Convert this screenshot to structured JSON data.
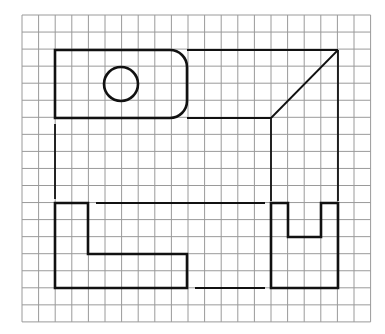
{
  "diagram": {
    "type": "three-view technical drawing",
    "grid": {
      "origin_x": 22,
      "origin_y": 15,
      "cell_w": 16.6,
      "cell_h": 17.05,
      "cols": 21,
      "rows": 18,
      "line_color": "#9a9a9a"
    },
    "colors": {
      "stroke": "#111111",
      "grid": "#9a9a9a",
      "background": "#ffffff"
    },
    "views": {
      "top_view": {
        "label": "top view",
        "outline": {
          "x": 55,
          "y": 50,
          "w": 132,
          "h": 68,
          "corner_radius_right": 17
        },
        "hole": {
          "cx": 121,
          "cy": 84,
          "r": 17
        }
      },
      "front_view": {
        "label": "front view",
        "points": [
          [
            55,
            203
          ],
          [
            88,
            203
          ],
          [
            88,
            254
          ],
          [
            187,
            254
          ],
          [
            187,
            288
          ],
          [
            55,
            288
          ]
        ]
      },
      "side_view": {
        "label": "side view",
        "points": [
          [
            271,
            203
          ],
          [
            288,
            203
          ],
          [
            288,
            237
          ],
          [
            321,
            237
          ],
          [
            321,
            203
          ],
          [
            338,
            203
          ],
          [
            338,
            288
          ],
          [
            271,
            288
          ]
        ]
      }
    },
    "projection_lines": [
      {
        "name": "top-edge-extension",
        "x1": 187,
        "y1": 50,
        "x2": 338,
        "y2": 50
      },
      {
        "name": "bottom-edge-extension",
        "x1": 187,
        "y1": 118,
        "x2": 271,
        "y2": 118
      },
      {
        "name": "miter-line",
        "x1": 271,
        "y1": 118,
        "x2": 338,
        "y2": 50
      },
      {
        "name": "side-left-drop",
        "x1": 271,
        "y1": 118,
        "x2": 271,
        "y2": 201
      },
      {
        "name": "side-right-drop",
        "x1": 338,
        "y1": 50,
        "x2": 338,
        "y2": 201
      },
      {
        "name": "front-left-drop",
        "x1": 55,
        "y1": 124,
        "x2": 55,
        "y2": 199
      },
      {
        "name": "front-top-link",
        "x1": 96,
        "y1": 203,
        "x2": 265,
        "y2": 203
      },
      {
        "name": "front-bottom-link",
        "x1": 195,
        "y1": 288,
        "x2": 265,
        "y2": 288
      }
    ]
  }
}
